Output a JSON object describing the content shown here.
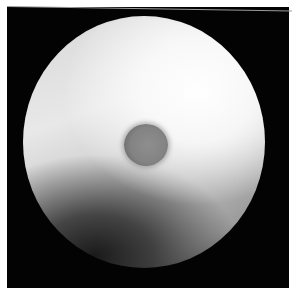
{
  "image": {
    "description": "Grayscale circular field-of-view image with a dark spherical object near the center",
    "colors": {
      "background": "#030303",
      "border": "#ffffff",
      "disc_highlight": "#fafafa",
      "disc_shadow": "#2a2a2a",
      "sphere": "#838383"
    }
  }
}
